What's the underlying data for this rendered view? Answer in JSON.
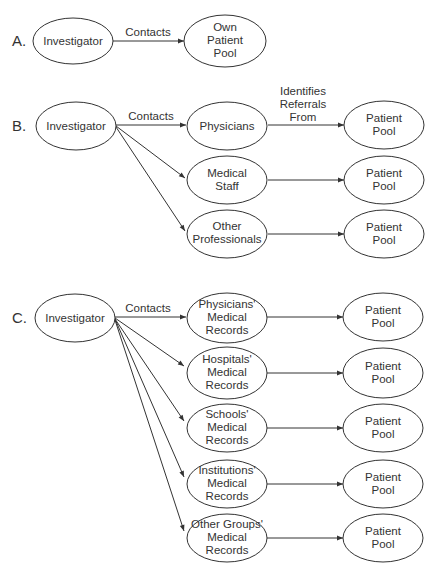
{
  "diagram": {
    "colors": {
      "stroke": "#333333",
      "text": "#333333",
      "background": "#ffffff"
    },
    "sections": [
      {
        "id": "A",
        "label": "A.",
        "nodes": [
          {
            "id": "inv",
            "lines": [
              "Investigator"
            ]
          },
          {
            "id": "p0",
            "lines": [
              "Own",
              "Patient",
              "Pool"
            ]
          }
        ],
        "edges": [
          {
            "from": "inv",
            "to": "p0",
            "label": [
              "Contacts"
            ]
          }
        ]
      },
      {
        "id": "B",
        "label": "B.",
        "nodes": [
          {
            "id": "inv",
            "lines": [
              "Investigator"
            ]
          },
          {
            "id": "m1",
            "lines": [
              "Physicians"
            ]
          },
          {
            "id": "m2",
            "lines": [
              "Medical",
              "Staff"
            ]
          },
          {
            "id": "m3",
            "lines": [
              "Other",
              "Professionals"
            ]
          },
          {
            "id": "p1",
            "lines": [
              "Patient",
              "Pool"
            ]
          },
          {
            "id": "p2",
            "lines": [
              "Patient",
              "Pool"
            ]
          },
          {
            "id": "p3",
            "lines": [
              "Patient",
              "Pool"
            ]
          }
        ],
        "edges": [
          {
            "from": "inv",
            "to": "m1",
            "label": [
              "Contacts"
            ]
          },
          {
            "from": "inv",
            "to": "m2",
            "label": []
          },
          {
            "from": "inv",
            "to": "m3",
            "label": []
          },
          {
            "from": "m1",
            "to": "p1",
            "label": [
              "Identifies",
              "Referrals",
              "From"
            ]
          },
          {
            "from": "m2",
            "to": "p2",
            "label": []
          },
          {
            "from": "m3",
            "to": "p3",
            "label": []
          }
        ]
      },
      {
        "id": "C",
        "label": "C.",
        "nodes": [
          {
            "id": "inv",
            "lines": [
              "Investigator"
            ]
          },
          {
            "id": "m1",
            "lines": [
              "Physicians'",
              "Medical",
              "Records"
            ]
          },
          {
            "id": "m2",
            "lines": [
              "Hospitals'",
              "Medical",
              "Records"
            ]
          },
          {
            "id": "m3",
            "lines": [
              "Schools'",
              "Medical",
              "Records"
            ]
          },
          {
            "id": "m4",
            "lines": [
              "Institutions'",
              "Medical",
              "Records"
            ]
          },
          {
            "id": "m5",
            "lines": [
              "Other Groups'",
              "Medical",
              "Records"
            ]
          },
          {
            "id": "p1",
            "lines": [
              "Patient",
              "Pool"
            ]
          },
          {
            "id": "p2",
            "lines": [
              "Patient",
              "Pool"
            ]
          },
          {
            "id": "p3",
            "lines": [
              "Patient",
              "Pool"
            ]
          },
          {
            "id": "p4",
            "lines": [
              "Patient",
              "Pool"
            ]
          },
          {
            "id": "p5",
            "lines": [
              "Patient",
              "Pool"
            ]
          }
        ],
        "edges": [
          {
            "from": "inv",
            "to": "m1",
            "label": [
              "Contacts"
            ]
          },
          {
            "from": "inv",
            "to": "m2",
            "label": []
          },
          {
            "from": "inv",
            "to": "m3",
            "label": []
          },
          {
            "from": "inv",
            "to": "m4",
            "label": []
          },
          {
            "from": "inv",
            "to": "m5",
            "label": []
          },
          {
            "from": "m1",
            "to": "p1",
            "label": []
          },
          {
            "from": "m2",
            "to": "p2",
            "label": []
          },
          {
            "from": "m3",
            "to": "p3",
            "label": []
          },
          {
            "from": "m4",
            "to": "p4",
            "label": []
          },
          {
            "from": "m5",
            "to": "p5",
            "label": []
          }
        ]
      }
    ]
  }
}
